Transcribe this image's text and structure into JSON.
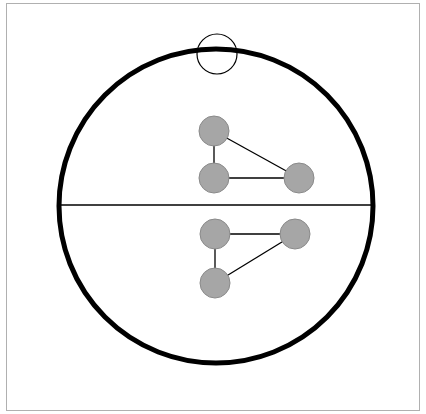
{
  "diagram": {
    "frame": {
      "x": 6,
      "y": 3,
      "width": 413,
      "height": 407,
      "stroke": "#b0b0b0"
    },
    "outer_circle": {
      "cx": 216,
      "cy": 206,
      "r": 157,
      "stroke": "#000000",
      "stroke_width": 5
    },
    "highlight_circle": {
      "cx": 217,
      "cy": 54,
      "r": 20,
      "stroke": "#000000",
      "stroke_width": 1.2
    },
    "divider": {
      "x1": 58,
      "y1": 205,
      "x2": 374,
      "y2": 205,
      "stroke": "#000000",
      "stroke_width": 1.4
    },
    "node_style": {
      "r": 15,
      "fill": "#a6a6a6",
      "stroke": "#8a8a8a"
    },
    "edge_style": {
      "stroke": "#000000",
      "stroke_width": 1.3
    },
    "graphs": [
      {
        "name": "upper-graph",
        "nodes": [
          {
            "id": "u1",
            "cx": 214,
            "cy": 131
          },
          {
            "id": "u2",
            "cx": 214,
            "cy": 178
          },
          {
            "id": "u3",
            "cx": 299,
            "cy": 178
          }
        ],
        "edges": [
          [
            "u1",
            "u2"
          ],
          [
            "u2",
            "u3"
          ],
          [
            "u1",
            "u3"
          ]
        ]
      },
      {
        "name": "lower-graph",
        "nodes": [
          {
            "id": "l1",
            "cx": 215,
            "cy": 234
          },
          {
            "id": "l2",
            "cx": 295,
            "cy": 234
          },
          {
            "id": "l3",
            "cx": 215,
            "cy": 283
          }
        ],
        "edges": [
          [
            "l1",
            "l2"
          ],
          [
            "l1",
            "l3"
          ],
          [
            "l2",
            "l3"
          ]
        ]
      }
    ]
  }
}
